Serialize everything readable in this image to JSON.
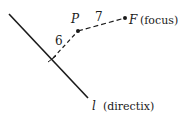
{
  "diagram": {
    "colors": {
      "ink": "#1a1a1a",
      "background": "#ffffff"
    },
    "directrix": {
      "symbol": "l",
      "caption": "(directix)",
      "start": [
        9,
        14
      ],
      "end": [
        88,
        98
      ]
    },
    "point_p": {
      "label": "P",
      "position": [
        78,
        31
      ]
    },
    "focus": {
      "symbol": "F",
      "caption": "(focus)",
      "position": [
        125,
        18
      ]
    },
    "foot_of_perpendicular": {
      "position": [
        52,
        59
      ]
    },
    "distances": {
      "p_to_directrix": "6",
      "p_to_focus": "7"
    }
  }
}
